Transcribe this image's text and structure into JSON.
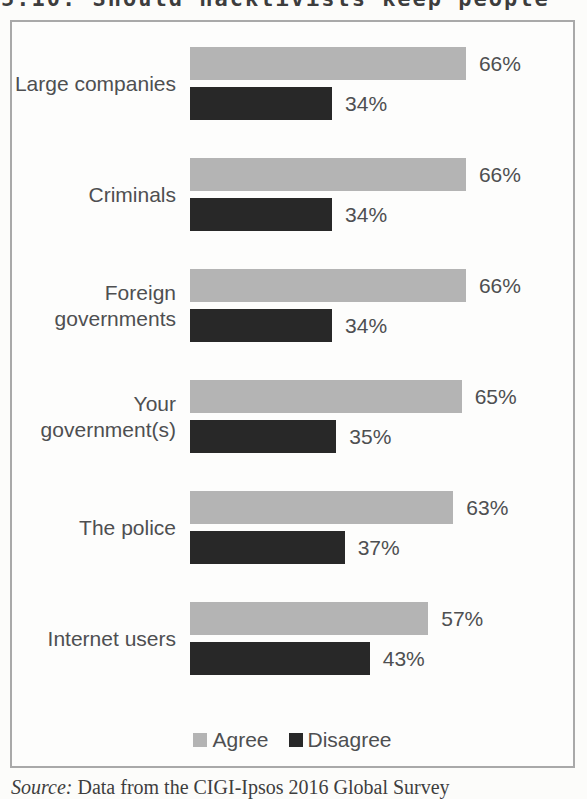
{
  "figure": {
    "title": "5.10: Should hacktivists keep people"
  },
  "chart_data": {
    "type": "bar",
    "orientation": "horizontal",
    "categories": [
      "Large companies",
      "Criminals",
      "Foreign governments",
      "Your government(s)",
      "The police",
      "Internet users"
    ],
    "series": [
      {
        "name": "Agree",
        "color": "#b4b4b4",
        "values": [
          66,
          66,
          66,
          65,
          63,
          57
        ]
      },
      {
        "name": "Disagree",
        "color": "#282828",
        "values": [
          34,
          34,
          34,
          35,
          37,
          43
        ]
      }
    ],
    "value_suffix": "%",
    "xlim": [
      0,
      100
    ],
    "grid": false,
    "legend_position": "bottom"
  },
  "legend": {
    "items": [
      {
        "label": "Agree",
        "color": "#b4b4b4"
      },
      {
        "label": "Disagree",
        "color": "#282828"
      }
    ]
  },
  "source": {
    "prefix": "Source:",
    "text": " Data from the CIGI-Ipsos 2016 Global Survey"
  }
}
